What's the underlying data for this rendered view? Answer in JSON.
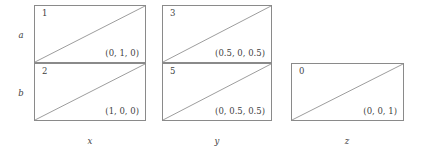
{
  "figure": {
    "row_labels": [
      {
        "text": "a",
        "x": 14,
        "y": 31
      },
      {
        "text": "b",
        "x": 14,
        "y": 89
      }
    ],
    "col_labels": [
      {
        "text": "x",
        "x": 75,
        "y": 137
      },
      {
        "text": "y",
        "x": 202,
        "y": 137
      },
      {
        "text": "z",
        "x": 332,
        "y": 137
      }
    ],
    "groups": [
      {
        "name": "group-x",
        "left": 34,
        "top": 5,
        "cells": [
          {
            "name": "cell-x-a",
            "index": "1",
            "coord": "(0, 1, 0)",
            "x": 0,
            "y": 0,
            "width": 112,
            "height": 58,
            "diagonal": "bottom-left-to-top-right"
          },
          {
            "name": "cell-x-b",
            "index": "2",
            "coord": "(1, 0, 0)",
            "x": 0,
            "y": 58,
            "width": 112,
            "height": 58,
            "diagonal": "bottom-left-to-top-right"
          }
        ]
      },
      {
        "name": "group-y",
        "left": 162,
        "top": 5,
        "cells": [
          {
            "name": "cell-y-a",
            "index": "3",
            "coord": "(0.5, 0, 0.5)",
            "x": 0,
            "y": 0,
            "width": 110,
            "height": 58,
            "diagonal": "bottom-left-to-top-right"
          },
          {
            "name": "cell-y-b",
            "index": "5",
            "coord": "(0, 0.5, 0.5)",
            "x": 0,
            "y": 58,
            "width": 110,
            "height": 58,
            "diagonal": "bottom-left-to-top-right"
          }
        ]
      },
      {
        "name": "group-z",
        "left": 291,
        "top": 63,
        "cells": [
          {
            "name": "cell-z-b",
            "index": "0",
            "coord": "(0, 0, 1)",
            "x": 0,
            "y": 0,
            "width": 113,
            "height": 58,
            "diagonal": "bottom-left-to-top-right"
          }
        ]
      }
    ],
    "colors": {
      "border": "#8a8a8a",
      "diagonal": "#9a9a9a",
      "text": "#3f3f3f",
      "background": "#ffffff"
    }
  }
}
